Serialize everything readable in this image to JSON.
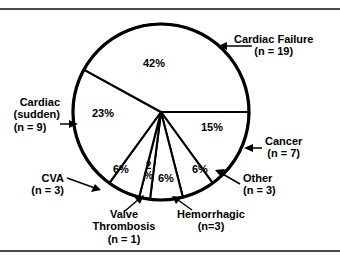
{
  "figure": {
    "title": "",
    "frame_color": "#4a4a4a",
    "slice_stroke": "#000000",
    "slice_fill": "#ffffff"
  },
  "chart_data": {
    "type": "pie",
    "title": "",
    "total_n": 45,
    "start_angle_deg": 0,
    "direction": "clockwise",
    "labels": [
      "Cardiac Failure",
      "Cardiac (sudden)",
      "CVA",
      "Valve Thrombosis",
      "Hemorrhagic",
      "Other",
      "Cancer"
    ],
    "values": [
      42,
      23,
      6,
      2,
      6,
      6,
      15
    ],
    "counts": [
      19,
      9,
      3,
      1,
      3,
      3,
      7
    ],
    "value_labels": [
      "42%",
      "23%",
      "6%",
      "2%",
      "6%",
      "6%",
      "15%"
    ],
    "count_labels": [
      "(n = 19)",
      "(n = 9)",
      "(n = 3)",
      "(n = 1)",
      "(n=3)",
      "(n = 3)",
      "(n = 7)"
    ],
    "legend": "none",
    "grid": false
  },
  "slice_pct": {
    "cardiac_failure": "42%",
    "cardiac_sudden": "23%",
    "cva": "6%",
    "valve_thrombosis_num": "2",
    "valve_thrombosis_sym": "%",
    "hemorrhagic": "6%",
    "other": "6%",
    "cancer": "15%"
  },
  "callouts": {
    "cardiac_failure": {
      "line1": "Cardiac Failure",
      "line2": "(n = 19)"
    },
    "cardiac_sudden": {
      "line1": "Cardiac",
      "line2": "(sudden)",
      "line3": "(n = 9)"
    },
    "cancer": {
      "line1": "Cancer",
      "line2": "(n = 7)"
    },
    "other": {
      "line1": "Other",
      "line2": "(n = 3)"
    },
    "cva": {
      "line1": "CVA",
      "line2": "(n = 3)"
    },
    "valve_thrombosis": {
      "line1": "Valve",
      "line2": "Thrombosis",
      "line3": "(n = 1)"
    },
    "hemorrhagic": {
      "line1": "Hemorrhagic",
      "line2": "(n=3)"
    }
  }
}
